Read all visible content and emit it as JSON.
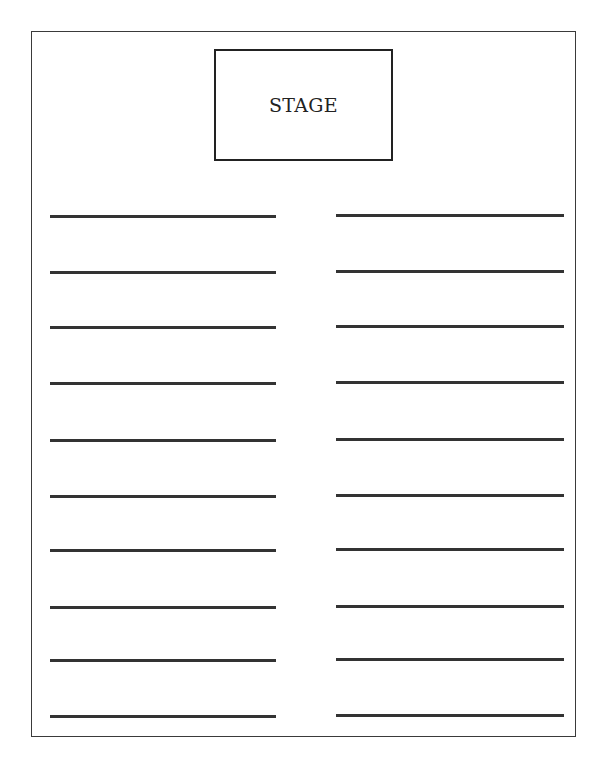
{
  "diagram": {
    "stage": {
      "label": "STAGE"
    },
    "left_rows": [
      216,
      272,
      327,
      383,
      440,
      496,
      550,
      607,
      660,
      716
    ],
    "right_rows": [
      215,
      271,
      326,
      382,
      439,
      495,
      549,
      606,
      659,
      715
    ],
    "colors": {
      "line": "#333333",
      "border": "#222222",
      "background": "#ffffff"
    }
  }
}
